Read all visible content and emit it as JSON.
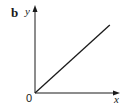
{
  "chart_data": {
    "type": "line",
    "panel_label": "b",
    "title": "",
    "xlabel": "x",
    "ylabel": "y",
    "origin_label": "0",
    "x_ticks": [],
    "y_ticks": [],
    "grid": false,
    "legend": null,
    "xlim": [
      0,
      1
    ],
    "ylim": [
      0,
      1
    ],
    "series": [
      {
        "name": "linear",
        "x": [
          0,
          0.88
        ],
        "y": [
          0,
          0.8
        ],
        "color": "#1a1a1a"
      }
    ]
  },
  "colors": {
    "ink": "#1a1a1a",
    "background": "#ffffff"
  }
}
